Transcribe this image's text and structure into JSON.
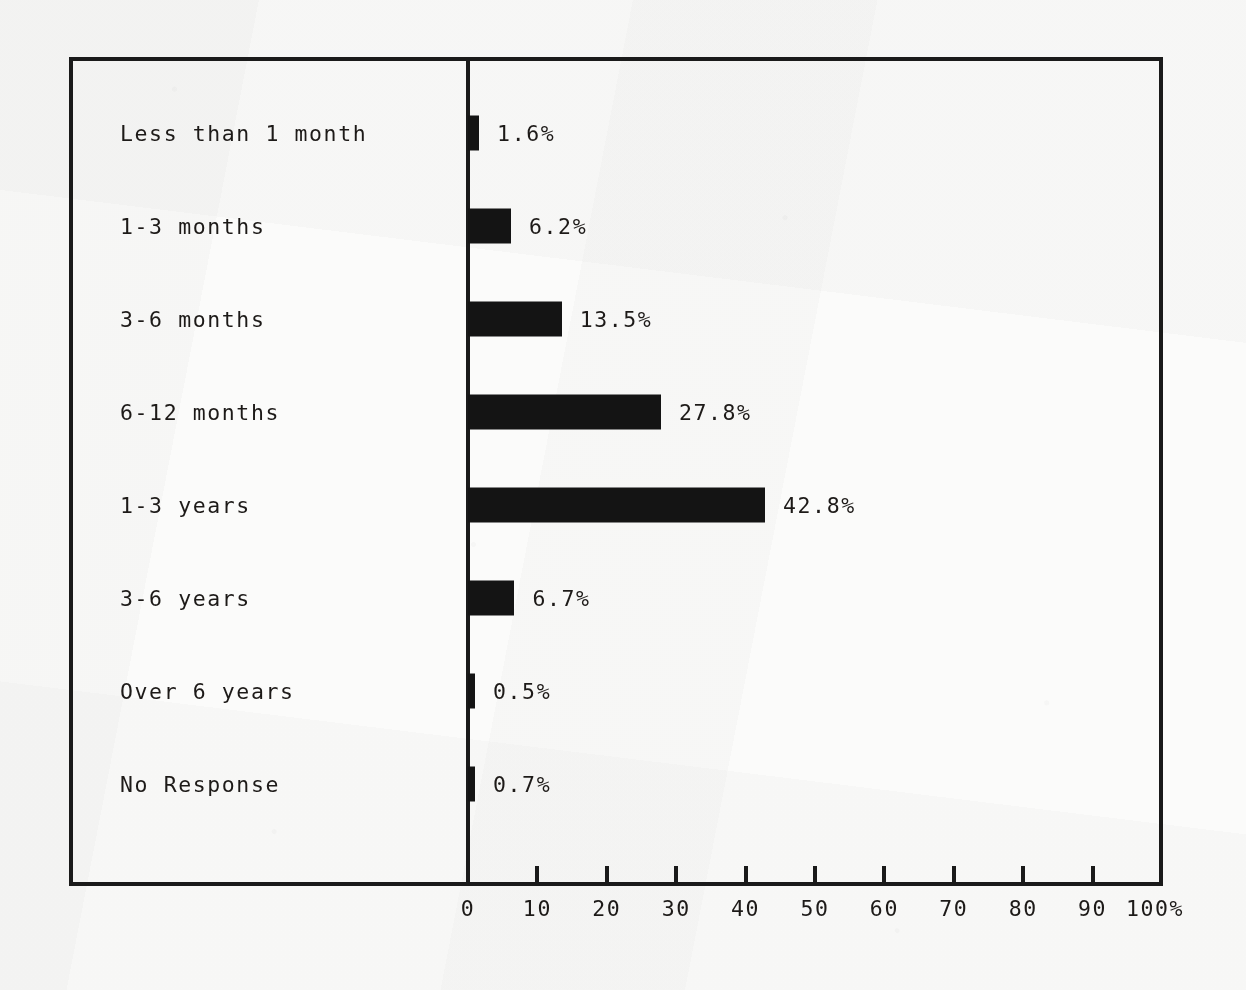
{
  "chart_data": {
    "type": "bar",
    "orientation": "horizontal",
    "title": "",
    "xlabel": "",
    "ylabel": "",
    "xlim": [
      0,
      100
    ],
    "grid": false,
    "legend": null,
    "axis_suffix": "%",
    "categories": [
      "Less than 1 month",
      "1-3 months",
      "3-6 months",
      "6-12 months",
      "1-3 years",
      "3-6 years",
      "Over 6 years",
      "No Response"
    ],
    "values": [
      1.6,
      6.2,
      13.5,
      27.8,
      42.8,
      6.7,
      0.5,
      0.7
    ],
    "value_labels": [
      "1.6%",
      "6.2%",
      "13.5%",
      "27.8%",
      "42.8%",
      "6.7%",
      "0.5%",
      "0.7%"
    ],
    "xticks": [
      0,
      10,
      20,
      30,
      40,
      50,
      60,
      70,
      80,
      90,
      100
    ],
    "xtick_labels": [
      "0",
      "10",
      "20",
      "30",
      "40",
      "50",
      "60",
      "70",
      "80",
      "90",
      "100%"
    ],
    "bar_color": "#141414",
    "axis_color": "#1a1a1a",
    "background_color": "#fbfbfa"
  }
}
